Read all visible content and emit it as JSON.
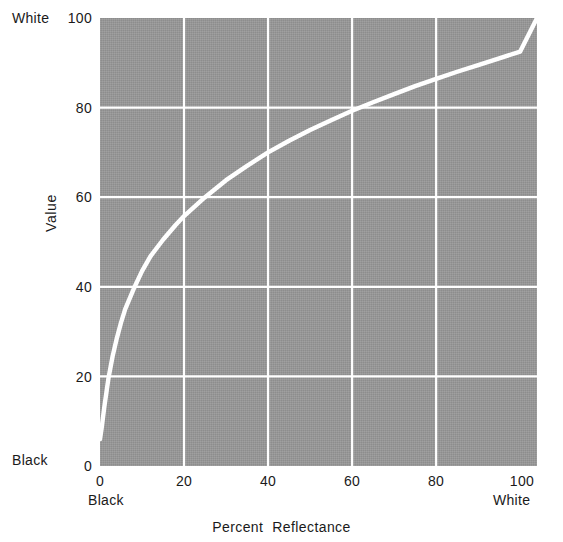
{
  "chart_data": {
    "type": "line",
    "title": "",
    "xlabel": "Percent  Reflectance",
    "xlabel_word1": "Percent",
    "xlabel_word2": "Reflectance",
    "ylabel": "Value",
    "xlim": [
      0,
      104
    ],
    "ylim": [
      0,
      100
    ],
    "grid": true,
    "legend": "none",
    "plot_background_color": "#969696",
    "line_color": "#ffffff",
    "grid_color": "#ffffff",
    "x_ticks": [
      "0",
      "20",
      "40",
      "60",
      "80",
      "100"
    ],
    "x_tick_values": [
      0,
      20,
      40,
      60,
      80,
      100
    ],
    "y_ticks": [
      "0",
      "20",
      "40",
      "60",
      "80",
      "100"
    ],
    "y_tick_values": [
      0,
      20,
      40,
      60,
      80,
      100
    ],
    "x_axis_low_label": "Black",
    "x_axis_high_label": "White",
    "y_axis_low_label": "Black",
    "y_axis_high_label": "White",
    "series": [
      {
        "name": "Munsell Value vs Percent Reflectance",
        "x": [
          0,
          0.4,
          1,
          2,
          3,
          4,
          5,
          6,
          8,
          10,
          12,
          15,
          18,
          20,
          25,
          30,
          35,
          40,
          45,
          50,
          55,
          60,
          65,
          70,
          75,
          80,
          85,
          90,
          95,
          100,
          104
        ],
        "y": [
          6.0,
          8.5,
          13.0,
          19.5,
          24.5,
          28.5,
          32.0,
          35.0,
          39.5,
          43.5,
          46.8,
          50.5,
          53.8,
          55.8,
          60.0,
          63.8,
          67.0,
          70.0,
          72.6,
          75.0,
          77.2,
          79.3,
          81.2,
          83.0,
          84.8,
          86.4,
          88.0,
          89.5,
          91.0,
          92.5,
          100.0
        ]
      }
    ],
    "annotations": []
  },
  "axes": {
    "y_tick_labels": [
      {
        "text": "100",
        "value": 100
      },
      {
        "text": "80",
        "value": 80
      },
      {
        "text": "60",
        "value": 60
      },
      {
        "text": "40",
        "value": 40
      },
      {
        "text": "20",
        "value": 20
      },
      {
        "text": "0",
        "value": 0
      }
    ],
    "x_tick_labels": [
      {
        "text": "0",
        "value": 0
      },
      {
        "text": "20",
        "value": 20
      },
      {
        "text": "40",
        "value": 40
      },
      {
        "text": "60",
        "value": 60
      },
      {
        "text": "80",
        "value": 80
      },
      {
        "text": "100",
        "value": 100
      }
    ],
    "y_top_end_label": "White",
    "y_bottom_end_label": "Black",
    "x_left_end_label": "Black",
    "x_right_end_label": "White",
    "y_axis_title": "Value",
    "x_axis_title_part1": "Percent",
    "x_axis_title_part2": "Reflectance"
  }
}
